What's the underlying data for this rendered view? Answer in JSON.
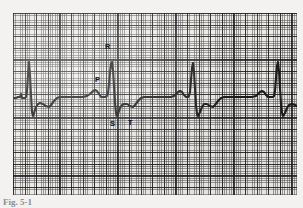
{
  "figure": {
    "kind": "ecg-rhythm-strip",
    "caption": "Fig. 5-1",
    "background_color": "#f4f2f0"
  },
  "paper": {
    "name": "ecg-graph-paper",
    "paper_color": "#eceae7",
    "fine_grid_color": "#464646",
    "major_grid_color": "#191919",
    "fine_grid_spacing_px": 2.32,
    "major_grid_spacing_px": 11.6,
    "small_boxes_per_large_box": 5
  },
  "trace": {
    "name": "ecg-trace",
    "stroke_color": "#1b1b1b",
    "stroke_width_px": 2.1
  },
  "labels": {
    "p": "P",
    "r": "R",
    "s": "S",
    "t": "T"
  },
  "chart_data": {
    "type": "line",
    "title": "Fig. 5-1",
    "xlabel": "",
    "ylabel": "",
    "grid": true,
    "legend": "none",
    "annotations": [
      {
        "label": "P",
        "x": 96,
        "y": 84,
        "description": "P wave - atrial depolarization"
      },
      {
        "label": "R",
        "x": 106,
        "y": 50,
        "description": "R wave - peak of QRS complex"
      },
      {
        "label": "S",
        "x": 111,
        "y": 124,
        "description": "S wave - terminal QRS deflection"
      },
      {
        "label": "T",
        "x": 129,
        "y": 124,
        "description": "T wave - ventricular repolarization"
      }
    ],
    "beats": 4,
    "beat_r_peak_x": [
      29,
      112,
      193,
      278
    ],
    "baseline_y": 98,
    "r_peak_y": 62,
    "s_trough_y": 116,
    "series": [
      {
        "name": "lead-II",
        "points": [
          [
            13,
            98
          ],
          [
            16,
            98
          ],
          [
            18,
            97
          ],
          [
            20,
            97
          ],
          [
            21,
            94
          ],
          [
            22,
            98
          ],
          [
            23,
            98
          ],
          [
            25,
            98
          ],
          [
            26,
            97
          ],
          [
            27,
            91
          ],
          [
            28,
            75
          ],
          [
            29,
            62
          ],
          [
            30,
            75
          ],
          [
            31,
            95
          ],
          [
            32,
            112
          ],
          [
            33,
            116
          ],
          [
            34,
            113
          ],
          [
            36,
            107
          ],
          [
            38,
            104
          ],
          [
            40,
            103
          ],
          [
            43,
            104
          ],
          [
            46,
            106
          ],
          [
            49,
            107
          ],
          [
            51,
            105
          ],
          [
            54,
            101
          ],
          [
            57,
            98
          ],
          [
            60,
            97
          ],
          [
            63,
            97
          ],
          [
            67,
            97
          ],
          [
            71,
            97
          ],
          [
            75,
            97
          ],
          [
            79,
            97
          ],
          [
            83,
            97
          ],
          [
            87,
            96
          ],
          [
            90,
            94
          ],
          [
            93,
            91
          ],
          [
            95,
            90
          ],
          [
            97,
            91
          ],
          [
            99,
            94
          ],
          [
            101,
            97
          ],
          [
            103,
            97
          ],
          [
            105,
            97
          ],
          [
            107,
            96
          ],
          [
            108,
            93
          ],
          [
            109,
            84
          ],
          [
            110,
            72
          ],
          [
            111,
            64
          ],
          [
            112,
            62
          ],
          [
            113,
            70
          ],
          [
            114,
            86
          ],
          [
            115,
            103
          ],
          [
            116,
            113
          ],
          [
            117,
            116
          ],
          [
            118,
            114
          ],
          [
            120,
            108
          ],
          [
            122,
            105
          ],
          [
            124,
            104
          ],
          [
            127,
            104
          ],
          [
            130,
            106
          ],
          [
            133,
            107
          ],
          [
            135,
            105
          ],
          [
            138,
            101
          ],
          [
            141,
            98
          ],
          [
            144,
            97
          ],
          [
            148,
            97
          ],
          [
            152,
            97
          ],
          [
            156,
            97
          ],
          [
            160,
            97
          ],
          [
            164,
            97
          ],
          [
            168,
            97
          ],
          [
            171,
            97
          ],
          [
            174,
            96
          ],
          [
            176,
            94
          ],
          [
            178,
            92
          ],
          [
            180,
            91
          ],
          [
            182,
            92
          ],
          [
            184,
            95
          ],
          [
            186,
            97
          ],
          [
            188,
            97
          ],
          [
            189,
            96
          ],
          [
            190,
            92
          ],
          [
            191,
            80
          ],
          [
            192,
            68
          ],
          [
            193,
            63
          ],
          [
            194,
            72
          ],
          [
            195,
            89
          ],
          [
            196,
            105
          ],
          [
            197,
            114
          ],
          [
            198,
            116
          ],
          [
            200,
            112
          ],
          [
            202,
            107
          ],
          [
            204,
            104
          ],
          [
            207,
            104
          ],
          [
            210,
            106
          ],
          [
            213,
            107
          ],
          [
            215,
            105
          ],
          [
            218,
            101
          ],
          [
            221,
            98
          ],
          [
            224,
            97
          ],
          [
            228,
            97
          ],
          [
            232,
            97
          ],
          [
            236,
            97
          ],
          [
            240,
            97
          ],
          [
            244,
            97
          ],
          [
            248,
            97
          ],
          [
            252,
            97
          ],
          [
            256,
            96
          ],
          [
            258,
            94
          ],
          [
            260,
            92
          ],
          [
            262,
            91
          ],
          [
            264,
            92
          ],
          [
            266,
            95
          ],
          [
            268,
            97
          ],
          [
            271,
            97
          ],
          [
            273,
            97
          ],
          [
            274,
            96
          ],
          [
            275,
            91
          ],
          [
            276,
            78
          ],
          [
            277,
            66
          ],
          [
            278,
            62
          ],
          [
            279,
            71
          ],
          [
            280,
            88
          ],
          [
            281,
            104
          ],
          [
            282,
            113
          ],
          [
            283,
            116
          ],
          [
            285,
            113
          ],
          [
            287,
            108
          ],
          [
            289,
            105
          ],
          [
            292,
            104
          ],
          [
            295,
            105
          ],
          [
            297,
            106
          ]
        ]
      }
    ]
  }
}
